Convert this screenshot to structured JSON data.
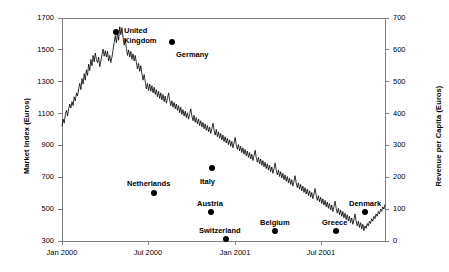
{
  "chart_data": {
    "type": "line",
    "title": "",
    "xlabel": "",
    "ylabel": "Market Index (Euros)",
    "y2label": "Revenue per Capita (Euros)",
    "grid": false,
    "legend": "none",
    "xlim": [
      "Jan 2000",
      "Dec 2001"
    ],
    "ylim": [
      300,
      1700
    ],
    "y2lim": [
      0,
      700
    ],
    "yticks": [
      300,
      500,
      700,
      900,
      1100,
      1300,
      1500,
      1700
    ],
    "y2ticks": [
      0,
      100,
      200,
      300,
      400,
      500,
      600,
      700
    ],
    "xticks": [
      "Jan 2000",
      "Jul 2000",
      "Jan 2001",
      "Jul 2001"
    ],
    "series": [
      {
        "name": "Market Index",
        "type": "line",
        "values": [
          1020,
          1065,
          1040,
          1095,
          1120,
          1085,
          1130,
          1160,
          1135,
          1175,
          1150,
          1205,
          1180,
          1230,
          1210,
          1255,
          1290,
          1250,
          1320,
          1285,
          1350,
          1310,
          1375,
          1340,
          1410,
          1370,
          1440,
          1400,
          1465,
          1425,
          1480,
          1440,
          1420,
          1455,
          1395,
          1430,
          1470,
          1505,
          1460,
          1495,
          1455,
          1490,
          1430,
          1465,
          1420,
          1455,
          1500,
          1545,
          1590,
          1545,
          1610,
          1560,
          1645,
          1595,
          1640,
          1580,
          1530,
          1570,
          1510,
          1465,
          1500,
          1455,
          1490,
          1440,
          1475,
          1430,
          1465,
          1420,
          1380,
          1415,
          1365,
          1400,
          1350,
          1310,
          1345,
          1300,
          1255,
          1290,
          1245,
          1285,
          1240,
          1275,
          1230,
          1265,
          1220,
          1250,
          1205,
          1240,
          1195,
          1230,
          1185,
          1220,
          1175,
          1210,
          1165,
          1195,
          1230,
          1185,
          1150,
          1180,
          1140,
          1170,
          1130,
          1160,
          1120,
          1150,
          1105,
          1140,
          1095,
          1125,
          1085,
          1115,
          1075,
          1105,
          1065,
          1095,
          1130,
          1085,
          1055,
          1090,
          1045,
          1075,
          1035,
          1065,
          1025,
          1055,
          1015,
          1045,
          1005,
          1035,
          995,
          1025,
          985,
          1015,
          975,
          1005,
          1040,
          995,
          965,
          1000,
          955,
          985,
          945,
          975,
          935,
          965,
          925,
          955,
          915,
          945,
          905,
          935,
          895,
          925,
          885,
          915,
          950,
          905,
          875,
          905,
          865,
          895,
          855,
          885,
          845,
          875,
          835,
          865,
          825,
          855,
          815,
          845,
          805,
          835,
          870,
          825,
          795,
          825,
          785,
          815,
          775,
          805,
          765,
          795,
          755,
          785,
          745,
          775,
          735,
          765,
          725,
          755,
          790,
          745,
          715,
          745,
          705,
          735,
          695,
          725,
          685,
          715,
          675,
          705,
          665,
          695,
          655,
          685,
          645,
          675,
          710,
          665,
          635,
          665,
          625,
          655,
          615,
          645,
          605,
          635,
          595,
          625,
          585,
          615,
          575,
          605,
          565,
          595,
          630,
          585,
          555,
          585,
          545,
          575,
          535,
          565,
          525,
          555,
          515,
          545,
          505,
          535,
          495,
          525,
          485,
          515,
          550,
          505,
          475,
          505,
          465,
          495,
          455,
          485,
          445,
          475,
          435,
          465,
          425,
          455,
          415,
          445,
          405,
          435,
          470,
          425,
          395,
          425,
          385,
          415,
          375,
          405,
          365,
          395,
          380,
          410,
          395,
          425,
          410,
          440,
          425,
          455,
          440,
          470,
          455,
          485,
          470,
          500,
          485,
          515,
          500,
          530
        ]
      }
    ],
    "annotations": [
      {
        "label": "United Kingdom",
        "label_lines": [
          "United",
          "Kingdom"
        ],
        "x_px": 116,
        "y_px": 32,
        "market_index": 1610,
        "label_x_px": 124,
        "label_y_px": 26
      },
      {
        "label": "Germany",
        "label_lines": [
          "Germany"
        ],
        "x_px": 172,
        "y_px": 42,
        "market_index": 1545,
        "label_x_px": 176,
        "label_y_px": 50
      },
      {
        "label": "Netherlands",
        "label_lines": [
          "Netherlands"
        ],
        "x_px": 154,
        "y_px": 193,
        "market_index": 635,
        "label_x_px": 127,
        "label_y_px": 179
      },
      {
        "label": "Italy",
        "label_lines": [
          "Italy"
        ],
        "x_px": 212,
        "y_px": 168,
        "market_index": 795,
        "label_x_px": 200,
        "label_y_px": 177
      },
      {
        "label": "Austria",
        "label_lines": [
          "Austria"
        ],
        "x_px": 211,
        "y_px": 212,
        "market_index": 520,
        "label_x_px": 197,
        "label_y_px": 199
      },
      {
        "label": "Switzerland",
        "label_lines": [
          "Switzerland"
        ],
        "x_px": 226,
        "y_px": 239,
        "market_index": 350,
        "label_x_px": 199,
        "label_y_px": 226
      },
      {
        "label": "Belgium",
        "label_lines": [
          "Belgium"
        ],
        "x_px": 275,
        "y_px": 231,
        "market_index": 400,
        "label_x_px": 260,
        "label_y_px": 218
      },
      {
        "label": "Greece",
        "label_lines": [
          "Greece"
        ],
        "x_px": 336,
        "y_px": 231,
        "market_index": 400,
        "label_x_px": 322,
        "label_y_px": 218
      },
      {
        "label": "Denmark",
        "label_lines": [
          "Denmark"
        ],
        "x_px": 365,
        "y_px": 212,
        "market_index": 520,
        "label_x_px": 349,
        "label_y_px": 199
      }
    ],
    "colors": {
      "line": "#000000",
      "marker": "#000000",
      "axis": "#808080",
      "text": "#000000",
      "background": "#ffffff"
    }
  }
}
